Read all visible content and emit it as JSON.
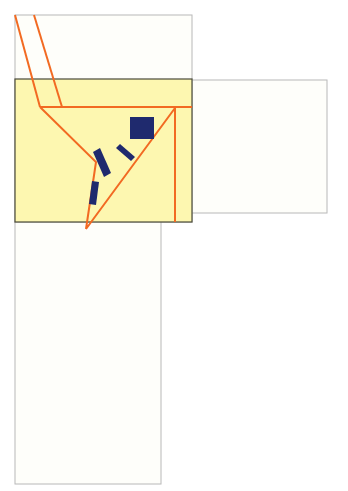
{
  "diagram": {
    "colors": {
      "panel_fill": "#fefefa",
      "panel_stroke": "#b8b8b8",
      "highlight_fill": "#fdf7b0",
      "highlight_stroke": "#4a4a3a",
      "line": "#f26a22",
      "block": "#1f2a6e"
    },
    "panels": [
      {
        "name": "top-panel",
        "x": 15,
        "y": 15,
        "w": 177,
        "h": 207
      },
      {
        "name": "right-panel",
        "x": 192,
        "y": 80,
        "w": 135,
        "h": 133
      },
      {
        "name": "bottom-panel",
        "x": 15,
        "y": 222,
        "w": 146,
        "h": 262
      }
    ],
    "highlight": {
      "x": 15,
      "y": 79,
      "w": 177,
      "h": 143
    },
    "lines": [
      {
        "name": "slant-line-left",
        "points": "15,15 40,107"
      },
      {
        "name": "slant-line-right",
        "points": "34,15 62,107"
      },
      {
        "name": "horizontal-line",
        "points": "40,107 192,107"
      },
      {
        "name": "funnel-outline",
        "points": "40,107 96,162 86,229 175,108"
      },
      {
        "name": "vertical-line",
        "points": "175,108 175,222"
      }
    ],
    "blocks": [
      {
        "name": "square-block",
        "points": "130,117 154,117 154,139 130,139"
      },
      {
        "name": "bar-block-1",
        "points": "93,152 100,148 111,173 104,177"
      },
      {
        "name": "bar-block-2",
        "points": "116,148 120,144 135,157 131,161"
      },
      {
        "name": "bar-block-3",
        "points": "92,181 99,182 96,205 89,204"
      }
    ]
  }
}
